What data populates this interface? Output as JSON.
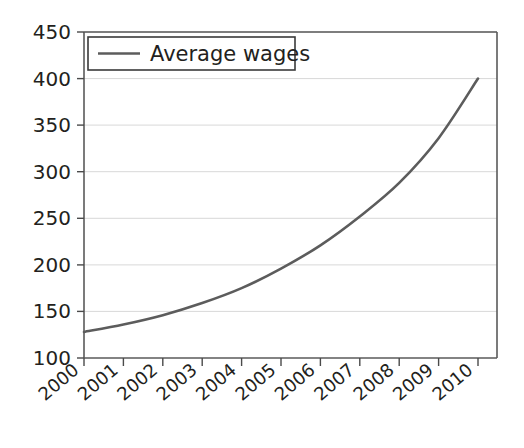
{
  "chart_data": {
    "type": "line",
    "title": "",
    "xlabel": "",
    "ylabel": "",
    "grid": true,
    "legend_position": "top-left",
    "xlim": [
      2000,
      2010
    ],
    "ylim": [
      100,
      450
    ],
    "ytick_step": 50,
    "categories": [
      "2000",
      "2001",
      "2002",
      "2003",
      "2004",
      "2005",
      "2006",
      "2007",
      "2008",
      "2009",
      "2010"
    ],
    "x": [
      2000,
      2001,
      2002,
      2003,
      2004,
      2005,
      2006,
      2007,
      2008,
      2009,
      2010
    ],
    "ytick_labels": [
      "100",
      "150",
      "200",
      "250",
      "300",
      "350",
      "400",
      "450"
    ],
    "ytick_values": [
      100,
      150,
      200,
      250,
      300,
      350,
      400,
      450
    ],
    "series": [
      {
        "name": "Average wages",
        "color": "#5c5c5c",
        "values": [
          128,
          136,
          146,
          159,
          175,
          196,
          221,
          252,
          288,
          336,
          400
        ]
      }
    ]
  },
  "legend": {
    "entries": [
      {
        "label": "Average wages",
        "color": "#5c5c5c"
      }
    ]
  },
  "axes": {
    "y_axis_name": "y-axis",
    "x_axis_name": "x-axis"
  }
}
